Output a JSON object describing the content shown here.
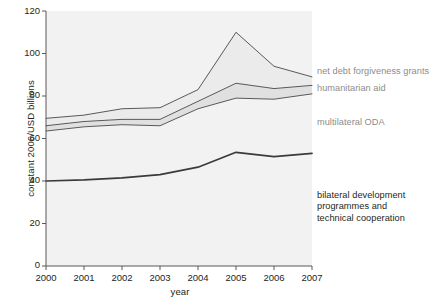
{
  "chart_data": {
    "type": "area",
    "title": "",
    "xlabel": "year",
    "ylabel": "constant 2006/USD billions",
    "x": [
      2000,
      2001,
      2002,
      2003,
      2004,
      2005,
      2006,
      2007
    ],
    "xlim": [
      2000,
      2007
    ],
    "ylim": [
      0,
      120
    ],
    "xticks": [
      "2000",
      "2001",
      "2002",
      "2003",
      "2004",
      "2005",
      "2006",
      "2007"
    ],
    "yticks": [
      "0",
      "20",
      "40",
      "60",
      "80",
      "100",
      "120"
    ],
    "grid": false,
    "legend_position": "right-inline-annotations",
    "stacked": true,
    "series": [
      {
        "name": "bilateral development programmes and technical cooperation",
        "label": "bilateral development\nprogrammes and\ntechnical cooperation",
        "values": [
          40,
          40.5,
          41.5,
          43,
          46.5,
          53.5,
          51.5,
          53
        ],
        "cumulative": [
          40,
          40.5,
          41.5,
          43,
          46.5,
          53.5,
          51.5,
          53
        ],
        "fill": "#f2f2f2",
        "line": "#3a3a3a",
        "label_color": "#231f20"
      },
      {
        "name": "multilateral ODA",
        "label": "multilateral ODA",
        "values": [
          23.5,
          25,
          25,
          23,
          27.5,
          25.5,
          27,
          28
        ],
        "cumulative": [
          63.5,
          65.5,
          66.5,
          66,
          74,
          79,
          78.5,
          81
        ],
        "fill": "#f2f2f2",
        "line": "#595959",
        "label_color": "#8c8c8c"
      },
      {
        "name": "humanitarian aid",
        "label": "humanitarian aid",
        "values": [
          2.5,
          2.5,
          2.5,
          3,
          3.5,
          7,
          5,
          4
        ],
        "cumulative": [
          66,
          68,
          69,
          69,
          77.5,
          86,
          83.5,
          85
        ],
        "fill": "#e0e0e0",
        "line": "#595959",
        "label_color": "#8c8c8c"
      },
      {
        "name": "net debt forgiveness grants",
        "label": "net debt forgiveness grants",
        "values": [
          3.5,
          3,
          5,
          5.5,
          5.5,
          24,
          10.5,
          4
        ],
        "cumulative": [
          69.5,
          71,
          74,
          74.5,
          83,
          110,
          94,
          89
        ],
        "fill": "#ebebeb",
        "line": "#595959",
        "label_color": "#8c8c8c"
      }
    ]
  },
  "axes": {
    "y_title": "constant 2006/USD billions",
    "x_title": "year",
    "y_ticks": [
      "120",
      "100",
      "80",
      "60",
      "40",
      "20",
      "0"
    ],
    "x_ticks": [
      "2000",
      "2001",
      "2002",
      "2003",
      "2004",
      "2005",
      "2006",
      "2007"
    ]
  },
  "annotations": {
    "net_debt": "net debt forgiveness grants",
    "humanitarian": "humanitarian aid",
    "multilateral": "multilateral ODA",
    "bilateral": "bilateral development\nprogrammes and\ntechnical cooperation"
  },
  "colors": {
    "axis": "#595959",
    "text_dark": "#231f20",
    "text_gray": "#8c8c8c",
    "plot_bg": "#f2f2f2",
    "band_light": "#ebebeb",
    "band_mid": "#e0e0e0",
    "line_dark": "#3a3a3a",
    "line_gray": "#595959"
  }
}
